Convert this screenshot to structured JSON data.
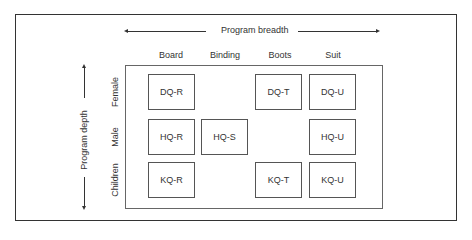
{
  "diagram": {
    "breadth_axis": {
      "label": "Program breadth"
    },
    "depth_axis": {
      "label": "Program depth"
    },
    "columns": [
      "Board",
      "Binding",
      "Boots",
      "Suit"
    ],
    "rows": [
      "Female",
      "Male",
      "Children"
    ],
    "cells": {
      "r0c0": "DQ-R",
      "r0c2": "DQ-T",
      "r0c3": "DQ-U",
      "r1c0": "HQ-R",
      "r1c1": "HQ-S",
      "r1c3": "HQ-U",
      "r2c0": "KQ-R",
      "r2c2": "KQ-T",
      "r2c3": "KQ-U"
    }
  }
}
